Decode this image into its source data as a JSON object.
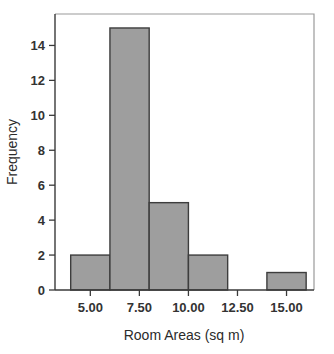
{
  "chart_data": {
    "type": "bar",
    "title": "",
    "subtitle": "",
    "xlabel": "Room Areas (sq m)",
    "ylabel": "Frequency",
    "xlim": [
      3.2,
      16.4
    ],
    "ylim": [
      0,
      15.8
    ],
    "grid": false,
    "legend": null,
    "bin_width": 2,
    "categories": [
      "4–6",
      "6–8",
      "8–10",
      "10–12",
      "12–14",
      "14–16"
    ],
    "bin_edges": [
      4,
      6,
      8,
      10,
      12,
      14,
      16
    ],
    "values": [
      2,
      15,
      5,
      2,
      0,
      1
    ],
    "bars": [
      {
        "left": 4,
        "right": 6,
        "value": 2
      },
      {
        "left": 6,
        "right": 8,
        "value": 15
      },
      {
        "left": 8,
        "right": 10,
        "value": 5
      },
      {
        "left": 10,
        "right": 12,
        "value": 2
      },
      {
        "left": 14,
        "right": 16,
        "value": 1
      }
    ],
    "xticks": [
      5.0,
      7.5,
      10.0,
      12.5,
      15.0
    ],
    "xticklabels": [
      "5.00",
      "7.50",
      "10.00",
      "12.50",
      "15.00"
    ],
    "yticks": [
      0,
      2,
      4,
      6,
      8,
      10,
      12,
      14
    ],
    "yticklabels": [
      "0",
      "2",
      "4",
      "6",
      "8",
      "10",
      "12",
      "14"
    ],
    "colors": {
      "bar_fill": "#9e9e9e",
      "bar_stroke": "#3d3d3d",
      "axis": "#3a3a3a",
      "frame": "#9a9a9a",
      "text": "#333333",
      "background": "#ffffff"
    }
  }
}
